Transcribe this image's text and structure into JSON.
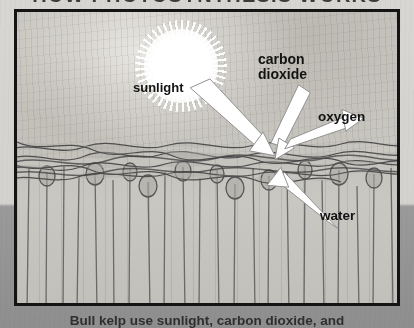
{
  "title": "HOW PHOTOSYNTHESIS WORKS",
  "caption": "Bull kelp use sunlight, carbon dioxide, and",
  "labels": {
    "sunlight": "sunlight",
    "carbon_dioxide_line1": "carbon",
    "carbon_dioxide_line2": "dioxide",
    "oxygen": "oxygen",
    "water": "water"
  },
  "icons": {
    "sun": "sun-icon",
    "kelp": "bull-kelp-icon",
    "arrow_sunlight": "arrow-icon",
    "arrow_carbon_dioxide": "arrow-icon",
    "arrow_oxygen": "arrow-icon",
    "arrow_water": "arrow-icon"
  },
  "colors": {
    "frame_border": "#141414",
    "label_text": "#131313",
    "title_text": "#3b3b3b",
    "arrow_fill": "#ffffff",
    "arrow_stroke": "#8d8d8d",
    "kelp_stroke": "#5f5f5f",
    "page_background": "#8e8e8e",
    "scene_background": "#c9c7c2"
  }
}
